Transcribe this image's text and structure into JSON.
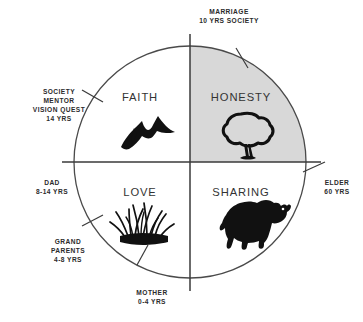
{
  "figure": {
    "name": "medicine-wheel",
    "background_color": "#ffffff",
    "line_color": "#3a3a3a",
    "shade_color": "#d8d8d8",
    "text_color": "#2b2b2b"
  },
  "circle": {
    "cx": 190,
    "cy": 162,
    "r": 116
  },
  "quadrants": [
    {
      "id": "faith",
      "label": "FAITH",
      "position": "top-left",
      "shaded": false,
      "icon": "mountains-icon",
      "label_x": 140,
      "label_y": 101
    },
    {
      "id": "honesty",
      "label": "HONESTY",
      "position": "top-right",
      "shaded": true,
      "icon": "tree-icon",
      "label_x": 241,
      "label_y": 101
    },
    {
      "id": "love",
      "label": "LOVE",
      "position": "bottom-left",
      "shaded": false,
      "icon": "grass-icon",
      "label_x": 140,
      "label_y": 196
    },
    {
      "id": "sharing",
      "label": "SHARING",
      "position": "bottom-right",
      "shaded": false,
      "icon": "buffalo-icon",
      "label_x": 241,
      "label_y": 196
    }
  ],
  "outer_labels": [
    {
      "id": "marriage",
      "lines": [
        "MARRIAGE",
        "10 YRS SOCIETY"
      ],
      "anchor": "middle",
      "x": 229,
      "y": 14,
      "angle_deg": 60
    },
    {
      "id": "society-mentor",
      "lines": [
        "SOCIETY",
        "MENTOR",
        "VISION QUEST",
        "14 YRS"
      ],
      "anchor": "middle",
      "x": 59,
      "y": 94,
      "angle_deg": 150
    },
    {
      "id": "dad",
      "lines": [
        "DAD",
        "8-14 YRS"
      ],
      "anchor": "middle",
      "x": 52,
      "y": 185,
      "angle_deg": 185
    },
    {
      "id": "grandparents",
      "lines": [
        "GRAND",
        "PARENTS",
        "4-8 YRS"
      ],
      "anchor": "middle",
      "x": 68,
      "y": 244,
      "angle_deg": 215
    },
    {
      "id": "mother",
      "lines": [
        "MOTHER",
        "0-4 YRS"
      ],
      "anchor": "middle",
      "x": 152,
      "y": 293,
      "angle_deg": 255
    },
    {
      "id": "elder",
      "lines": [
        "ELDER",
        "60 YRS"
      ],
      "anchor": "middle",
      "x": 335,
      "y": 185,
      "angle_deg": 5
    }
  ],
  "tick_marks": [
    {
      "id": "tick-marriage",
      "angle_deg": 60
    },
    {
      "id": "tick-society-mentor",
      "angle_deg": 150
    },
    {
      "id": "tick-dad",
      "angle_deg": 180
    },
    {
      "id": "tick-grandparents",
      "angle_deg": 215
    },
    {
      "id": "tick-mother",
      "angle_deg": 255
    },
    {
      "id": "tick-elder",
      "angle_deg": 0
    }
  ],
  "axes": {
    "horizontal": {
      "x1": 62,
      "y1": 162,
      "x2": 321,
      "y2": 162
    },
    "vertical": {
      "x1": 190,
      "y1": 34,
      "x2": 190,
      "y2": 291
    }
  }
}
